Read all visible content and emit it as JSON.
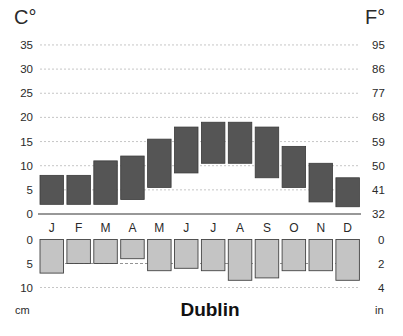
{
  "chart_data": [
    {
      "type": "bar",
      "subtype": "floating-range",
      "title": "Dublin",
      "ylabel_left": "C°",
      "ylabel_right": "F°",
      "categories": [
        "J",
        "F",
        "M",
        "A",
        "M",
        "J",
        "J",
        "A",
        "S",
        "O",
        "N",
        "D"
      ],
      "series": [
        {
          "name": "Min temperature (°C)",
          "values": [
            2,
            2,
            2,
            3,
            5.5,
            8.5,
            10.5,
            10.5,
            7.5,
            5.5,
            2.5,
            1.5
          ]
        },
        {
          "name": "Max temperature (°C)",
          "values": [
            8,
            8,
            11,
            12,
            15.5,
            18,
            19,
            19,
            18,
            14,
            10.5,
            7.5
          ]
        }
      ],
      "yticks_left": [
        0,
        5,
        10,
        15,
        20,
        25,
        30,
        35
      ],
      "yticks_right": [
        32,
        41,
        50,
        59,
        68,
        77,
        86,
        95
      ],
      "ylim": [
        0,
        35
      ],
      "grid": true,
      "colors": {
        "bar": "#555555"
      }
    },
    {
      "type": "bar",
      "subtype": "inverted",
      "title": "Dublin",
      "xlabel": "",
      "ylabel_left": "cm",
      "ylabel_right": "in",
      "categories": [
        "J",
        "F",
        "M",
        "A",
        "M",
        "J",
        "J",
        "A",
        "S",
        "O",
        "N",
        "D"
      ],
      "series": [
        {
          "name": "Precipitation (cm)",
          "values": [
            7,
            5,
            5,
            4,
            6.5,
            6,
            6.5,
            8.5,
            8,
            6.5,
            6.5,
            8.5
          ]
        }
      ],
      "yticks_left": [
        0,
        5,
        10
      ],
      "yticks_right": [
        0,
        2,
        4
      ],
      "ylim": [
        0,
        10
      ],
      "grid": true,
      "colors": {
        "bar": "#c4c4c4"
      }
    }
  ],
  "labels": {
    "title": "Dublin",
    "temp_unit_left": "C°",
    "temp_unit_right": "F°",
    "precip_unit_left": "cm",
    "precip_unit_right": "in"
  }
}
